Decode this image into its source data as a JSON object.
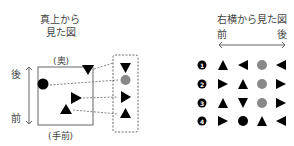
{
  "top_view": {
    "title_line1": "真上から",
    "title_line2": "見た図",
    "back_label": "(奥)",
    "front_label": "(手前)",
    "axis_back": "後",
    "axis_front": "前",
    "objects": [
      {
        "shape": "triangle-down",
        "color": "#000000"
      },
      {
        "shape": "circle",
        "color": "#000000"
      },
      {
        "shape": "triangle-right",
        "color": "#000000"
      },
      {
        "shape": "triangle-up",
        "color": "#000000"
      }
    ],
    "projection_column": [
      {
        "shape": "triangle-down",
        "color": "#000000"
      },
      {
        "shape": "circle",
        "color": "#888888"
      },
      {
        "shape": "triangle-right",
        "color": "#000000"
      },
      {
        "shape": "triangle-up",
        "color": "#000000"
      }
    ]
  },
  "side_view": {
    "title": "右横から見た図",
    "axis_front": "前",
    "axis_back": "後",
    "options": [
      {
        "number": "1",
        "shapes": [
          "triangle-up",
          "triangle-left",
          "circle-gray",
          "triangle-left"
        ]
      },
      {
        "number": "2",
        "shapes": [
          "triangle-right",
          "triangle-up",
          "circle-gray",
          "triangle-right"
        ]
      },
      {
        "number": "3",
        "shapes": [
          "triangle-up",
          "triangle-down",
          "circle-gray",
          "triangle-right"
        ]
      },
      {
        "number": "4",
        "shapes": [
          "triangle-right",
          "circle-black",
          "triangle-up",
          "triangle-left"
        ]
      }
    ]
  },
  "colors": {
    "black": "#000000",
    "gray_circle": "#888888",
    "line": "#666666"
  }
}
